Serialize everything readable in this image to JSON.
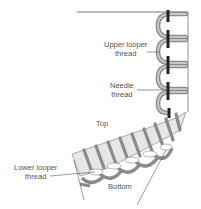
{
  "labels": {
    "upper_looper": [
      "Upper looper",
      "thread"
    ],
    "needle": [
      "Needle",
      "thread"
    ],
    "top": "Top",
    "lower_looper": [
      "Lower looper",
      "thread"
    ],
    "bottom": "Bottom"
  },
  "colors": {
    "thread_gray": "#a8a8a8",
    "thread_outline": "#6e6e6e",
    "needle_thread": "#222222",
    "fabric": "#e6e6e6",
    "leader_line": "#555555",
    "text": "#555555"
  }
}
